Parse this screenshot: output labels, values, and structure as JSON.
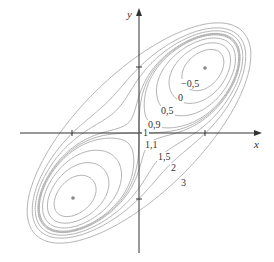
{
  "chart_data": {
    "type": "contour",
    "title": "",
    "function_hint": "level curves with two minima and a saddle at the origin",
    "xlabel": "x",
    "ylabel": "y",
    "x_ticks": [
      -1,
      1
    ],
    "y_ticks": [
      -1,
      1
    ],
    "xlim": [
      -1.9,
      1.9
    ],
    "ylim": [
      -1.9,
      1.9
    ],
    "grid": false,
    "levels": [
      -0.5,
      0,
      0.5,
      0.9,
      1,
      1.1,
      1.5,
      2,
      3
    ],
    "level_labels": [
      "−0,5",
      "0",
      "0,5",
      "0,9",
      "1",
      "1,1",
      "1,5",
      "2",
      "3"
    ],
    "critical_points": [
      {
        "x": 1,
        "y": 1,
        "type": "minimum"
      },
      {
        "x": -1,
        "y": -1,
        "type": "minimum"
      },
      {
        "x": 0,
        "y": 0,
        "type": "saddle"
      }
    ],
    "line_color": "#a8a8a8",
    "axis_color": "#333333",
    "point_color": "#888888"
  },
  "labels": {
    "x_axis": "x",
    "y_axis": "y",
    "l_m05": "−0,5",
    "l_0": "0",
    "l_05": "0,5",
    "l_09": "0,9",
    "l_1": "1",
    "l_11": "1,1",
    "l_15": "1,5",
    "l_2": "2",
    "l_3": "3"
  }
}
